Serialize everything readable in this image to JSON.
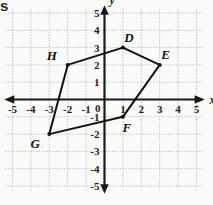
{
  "page": {
    "corner_text_fragment": "s",
    "background_color": "#fbfbfa"
  },
  "axes": {
    "x_label": "x",
    "y_label": "y",
    "origin_label": "0",
    "axis_color": "#1a1a1a",
    "grid_color": "#b9b9c4",
    "x_ticks": [
      "-5",
      "-4",
      "-3",
      "-2",
      "-1",
      "1",
      "2",
      "3",
      "4",
      "5"
    ],
    "y_ticks": [
      "5",
      "4",
      "3",
      "2",
      "1",
      "-1",
      "-2",
      "-3",
      "-4",
      "-5"
    ]
  },
  "chart_data": {
    "type": "scatter",
    "title": "",
    "xlabel": "x",
    "ylabel": "y",
    "xlim": [
      -5,
      5
    ],
    "ylim": [
      -5,
      5
    ],
    "grid": true,
    "legend": "none",
    "x_ticks": [
      -5,
      -4,
      -3,
      -2,
      -1,
      0,
      1,
      2,
      3,
      4,
      5
    ],
    "y_ticks": [
      -5,
      -4,
      -3,
      -2,
      -1,
      0,
      1,
      2,
      3,
      4,
      5
    ],
    "shape": {
      "name": "polygon-defgh",
      "closed": true,
      "stroke_color": "#111111",
      "fill": "none",
      "vertices": [
        {
          "label": "D",
          "x": 1,
          "y": 3,
          "label_dx": 6,
          "label_dy": -6
        },
        {
          "label": "E",
          "x": 3,
          "y": 2,
          "label_dx": 6,
          "label_dy": -6
        },
        {
          "label": "F",
          "x": 1,
          "y": -1,
          "label_dx": 4,
          "label_dy": 15
        },
        {
          "label": "G",
          "x": -3,
          "y": -2,
          "label_dx": -14,
          "label_dy": 14
        },
        {
          "label": "H",
          "x": -2,
          "y": 2,
          "label_dx": -16,
          "label_dy": -5
        }
      ]
    }
  }
}
